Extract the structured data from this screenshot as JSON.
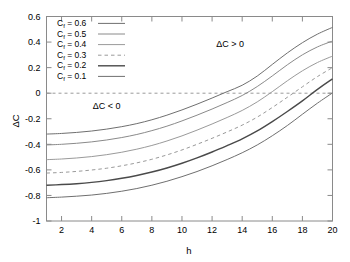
{
  "chart_data": {
    "type": "line",
    "title": "",
    "xlabel": "h",
    "ylabel": "ΔC",
    "xlim": [
      1,
      20
    ],
    "ylim": [
      -1,
      0.6
    ],
    "xticks": [
      "2",
      "4",
      "6",
      "8",
      "10",
      "12",
      "14",
      "16",
      "18",
      "20"
    ],
    "xtick_values": [
      2,
      4,
      6,
      8,
      10,
      12,
      14,
      16,
      18,
      20
    ],
    "yticks": [
      "0.6",
      "0.4",
      "0.2",
      "0",
      "-0.2",
      "-0.4",
      "-0.6",
      "-0.8",
      "-1"
    ],
    "ytick_values": [
      0.6,
      0.4,
      0.2,
      0,
      -0.2,
      -0.4,
      -0.6,
      -0.8,
      -1
    ],
    "grid": false,
    "legend_position": "top-left",
    "x": [
      1,
      2,
      3,
      4,
      5,
      6,
      7,
      8,
      9,
      10,
      11,
      12,
      13,
      14,
      15,
      16,
      17,
      18,
      19,
      20
    ],
    "series": [
      {
        "name": "C_f = 0.6",
        "label": "C",
        "subscript": "f",
        "value": "0.6",
        "style": "solid",
        "color": "#6f6f6f",
        "width": 1,
        "values": [
          -0.32,
          -0.315,
          -0.307,
          -0.296,
          -0.281,
          -0.262,
          -0.238,
          -0.208,
          -0.172,
          -0.131,
          -0.086,
          -0.038,
          0.012,
          0.062,
          0.134,
          0.225,
          0.315,
          0.395,
          0.462,
          0.515
        ]
      },
      {
        "name": "C_f = 0.5",
        "label": "C",
        "subscript": "f",
        "value": "0.5",
        "style": "solid",
        "color": "#8a8a8a",
        "width": 1,
        "values": [
          -0.405,
          -0.4,
          -0.392,
          -0.381,
          -0.366,
          -0.347,
          -0.323,
          -0.293,
          -0.258,
          -0.217,
          -0.172,
          -0.124,
          -0.073,
          -0.018,
          0.052,
          0.135,
          0.222,
          0.3,
          0.362,
          0.408
        ]
      },
      {
        "name": "C_f = 0.4",
        "label": "C",
        "subscript": "f",
        "value": "0.4",
        "style": "solid",
        "color": "#9a9a9a",
        "width": 1,
        "values": [
          -0.52,
          -0.515,
          -0.507,
          -0.496,
          -0.481,
          -0.462,
          -0.438,
          -0.409,
          -0.374,
          -0.334,
          -0.289,
          -0.241,
          -0.19,
          -0.135,
          -0.068,
          0.012,
          0.097,
          0.175,
          0.24,
          0.29
        ]
      },
      {
        "name": "C_f = 0.3",
        "label": "C",
        "subscript": "f",
        "value": "0.3",
        "style": "dashed",
        "color": "#9a9a9a",
        "width": 1,
        "values": [
          -0.625,
          -0.62,
          -0.612,
          -0.601,
          -0.587,
          -0.568,
          -0.545,
          -0.517,
          -0.483,
          -0.444,
          -0.4,
          -0.353,
          -0.303,
          -0.25,
          -0.187,
          -0.112,
          -0.032,
          0.05,
          0.13,
          0.2
        ]
      },
      {
        "name": "C_f = 0.2",
        "label": "C",
        "subscript": "f",
        "value": "0.2",
        "style": "solid",
        "color": "#4a4a4a",
        "width": 1.4,
        "values": [
          -0.72,
          -0.715,
          -0.708,
          -0.698,
          -0.684,
          -0.666,
          -0.644,
          -0.617,
          -0.585,
          -0.548,
          -0.506,
          -0.46,
          -0.41,
          -0.357,
          -0.295,
          -0.222,
          -0.143,
          -0.06,
          0.03,
          0.112
        ]
      },
      {
        "name": "C_f = 0.1",
        "label": "C",
        "subscript": "f",
        "value": "0.1",
        "style": "solid",
        "color": "#6f6f6f",
        "width": 1,
        "values": [
          -0.818,
          -0.813,
          -0.806,
          -0.797,
          -0.784,
          -0.767,
          -0.746,
          -0.72,
          -0.689,
          -0.653,
          -0.613,
          -0.568,
          -0.519,
          -0.466,
          -0.405,
          -0.333,
          -0.253,
          -0.165,
          -0.078,
          0.002
        ]
      }
    ],
    "annotations": [
      {
        "text": "ΔC > 0",
        "x": 13.2,
        "y": 0.36
      },
      {
        "text": "ΔC < 0",
        "x": 5.0,
        "y": -0.12
      }
    ],
    "zero_line": {
      "value": 0,
      "style": "dashed",
      "color": "#9a9a9a"
    }
  }
}
